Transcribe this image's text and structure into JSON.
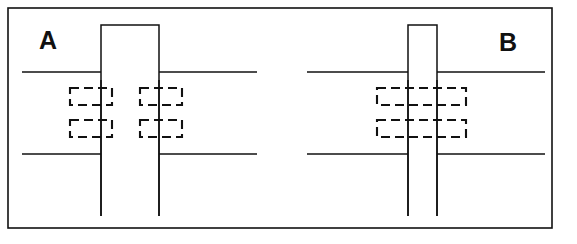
{
  "figure": {
    "width": 577,
    "height": 244,
    "background_color": "#ffffff",
    "line_color": "#111111",
    "frame": {
      "name": "outer-border",
      "x": 8,
      "y": 8,
      "width": 544,
      "height": 220,
      "stroke_width": 1.6,
      "color": "#111111"
    }
  },
  "panels": [
    {
      "id": "A",
      "label": "A",
      "label_x": 48,
      "label_y": 42,
      "divider_x": 288,
      "column": {
        "name": "column-outline",
        "left_x": 101,
        "right_x": 159,
        "top_y": 25,
        "bottom_y": 216,
        "top_closed": true,
        "bottom_closed": false,
        "stroke_width": 1.5
      },
      "slab_lines": [
        {
          "name": "upper-slab-line-left",
          "x1": 22,
          "x2": 101,
          "y": 72
        },
        {
          "name": "upper-slab-line-right",
          "x1": 159,
          "x2": 257,
          "y": 72
        },
        {
          "name": "lower-slab-line-left",
          "x1": 22,
          "x2": 101,
          "y": 154
        },
        {
          "name": "lower-slab-line-right",
          "x1": 159,
          "x2": 257,
          "y": 154
        }
      ],
      "dashed_boxes": [
        {
          "name": "rebar-box-upper-left",
          "x": 70,
          "y": 88,
          "width": 42,
          "height": 17
        },
        {
          "name": "rebar-box-upper-right",
          "x": 140,
          "y": 88,
          "width": 42,
          "height": 17
        },
        {
          "name": "rebar-box-lower-left",
          "x": 70,
          "y": 120,
          "width": 42,
          "height": 17
        },
        {
          "name": "rebar-box-lower-right",
          "x": 140,
          "y": 120,
          "width": 42,
          "height": 17
        }
      ],
      "dashed_box_count": 4,
      "dashed_box_style": "narrow boxes straddling each column face"
    },
    {
      "id": "B",
      "label": "B",
      "label_x": 508,
      "label_y": 44,
      "column": {
        "name": "column-outline",
        "left_x": 408,
        "right_x": 437,
        "top_y": 25,
        "bottom_y": 216,
        "top_closed": true,
        "bottom_closed": false,
        "stroke_width": 1.5
      },
      "slab_lines": [
        {
          "name": "upper-slab-line-left",
          "x1": 307,
          "x2": 408,
          "y": 72
        },
        {
          "name": "upper-slab-line-right",
          "x1": 437,
          "x2": 545,
          "y": 72
        },
        {
          "name": "lower-slab-line-left",
          "x1": 307,
          "x2": 408,
          "y": 154
        },
        {
          "name": "lower-slab-line-right",
          "x1": 437,
          "x2": 545,
          "y": 154
        }
      ],
      "dashed_boxes": [
        {
          "name": "rebar-box-upper-wide",
          "x": 377,
          "y": 88,
          "width": 89,
          "height": 17
        },
        {
          "name": "rebar-box-lower-wide",
          "x": 377,
          "y": 120,
          "width": 89,
          "height": 17
        }
      ],
      "dashed_box_count": 2,
      "dashed_box_style": "wide boxes spanning the full column width"
    }
  ],
  "dash_pattern": "9 5",
  "dash_stroke_width": 2.1
}
